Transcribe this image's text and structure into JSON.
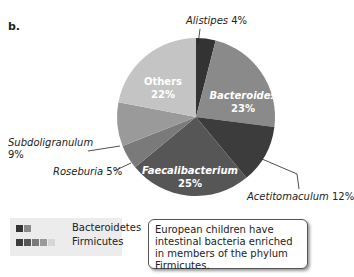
{
  "panel_label": "b.",
  "chart_data": {
    "type": "pie",
    "title": "",
    "slices": [
      {
        "name": "Alistipes",
        "value": 4,
        "label": "Alistipes 4%",
        "phylum": "Bacteroidetes",
        "color": "#333333"
      },
      {
        "name": "Bacteroides",
        "value": 23,
        "label": "Bacteroides 23%",
        "phylum": "Bacteroidetes",
        "color": "#8a8a8a"
      },
      {
        "name": "Acetitomaculum",
        "value": 12,
        "label": "Acetitomaculum 12%",
        "phylum": "Firmicutes",
        "color": "#3c3c3c"
      },
      {
        "name": "Faecalibacterium",
        "value": 25,
        "label": "Faecalibacterium 25%",
        "phylum": "Firmicutes",
        "color": "#565656"
      },
      {
        "name": "Roseburia",
        "value": 5,
        "label": "Roseburia 5%",
        "phylum": "Firmicutes",
        "color": "#7a7a7a"
      },
      {
        "name": "Subdoligranulum",
        "value": 9,
        "label": "Subdoligranulum 9%",
        "phylum": "Firmicutes",
        "color": "#9a9a9a"
      },
      {
        "name": "Others",
        "value": 22,
        "label": "Others 22%",
        "phylum": "Others",
        "color": "#c4c4c4"
      }
    ],
    "legend": [
      {
        "name": "Bacteroidetes",
        "swatches": [
          "#333333",
          "#8a8a8a"
        ]
      },
      {
        "name": "Firmicutes",
        "swatches": [
          "#3c3c3c",
          "#565656",
          "#7a7a7a",
          "#9a9a9a",
          "#d6d6d6"
        ]
      }
    ]
  },
  "labels": {
    "alistipes": "Alistipes",
    "alistipes_pct": "4%",
    "bacteroides": "Bacteroides",
    "bacteroides_pct": "23%",
    "others": "Others",
    "others_pct": "22%",
    "subdoligranulum": "Subdoligranulum",
    "subdoligranulum_pct": "9%",
    "roseburia": "Roseburia",
    "roseburia_pct": "5%",
    "faecalibacterium": "Faecalibacterium",
    "faecalibacterium_pct": "25%",
    "acetitomaculum": "Acetitomaculum",
    "acetitomaculum_pct": "12%"
  },
  "legend": {
    "bacteroidetes": "Bacteroidetes",
    "firmicutes": "Firmicutes"
  },
  "callout": "European children have intestinal bacteria enriched in members of the phylum Firmicutes."
}
